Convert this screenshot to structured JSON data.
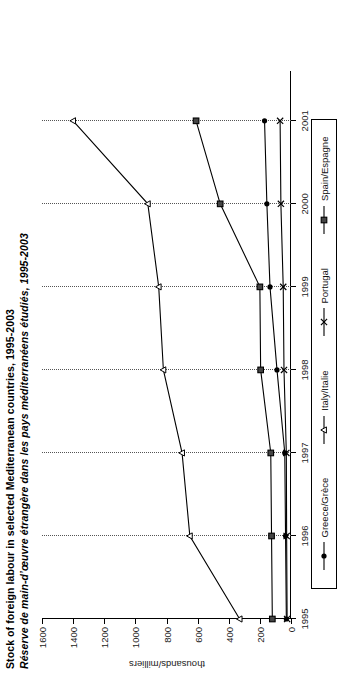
{
  "title": {
    "en": "Stock of foreign labour in selected Mediterranean countries, 1995-2003",
    "fr": "Réserve de main-d’œuvre étrangère dans les pays méditerranéens étudiés, 1995-2003"
  },
  "chart_data": {
    "type": "line",
    "title": "Stock of foreign labour in selected Mediterranean countries, 1995-2003",
    "subtitle": "Réserve de main-d’œuvre étrangère dans les pays méditerranéens étudiés, 1995-2003",
    "xlabel": "",
    "ylabel": "thousands/milliers",
    "x": [
      1995,
      1996,
      1997,
      1998,
      1999,
      2000,
      2001
    ],
    "xtick_labels": [
      "1995",
      "1996",
      "1997",
      "1998",
      "1999",
      "2000",
      "2001"
    ],
    "xlim": [
      1995,
      2001.6
    ],
    "ylim": [
      0,
      1600
    ],
    "yticks": [
      0,
      200,
      400,
      600,
      800,
      1000,
      1200,
      1400,
      1600
    ],
    "ytick_labels": [
      "0",
      "200",
      "400",
      "600",
      "800",
      "1000",
      "1200",
      "1400",
      "1600"
    ],
    "grid": "vertical-dotted",
    "legend_position": "bottom",
    "series": [
      {
        "name": "Greece/Grèce",
        "marker": "filled-circle",
        "color": "#000000",
        "values": [
          30,
          35,
          40,
          90,
          135,
          155,
          170
        ]
      },
      {
        "name": "Italy/Italie",
        "marker": "open-triangle",
        "color": "#000000",
        "values": [
          330,
          650,
          700,
          820,
          850,
          920,
          1400
        ]
      },
      {
        "name": "Portugal",
        "marker": "cross-x",
        "color": "#000000",
        "values": [
          25,
          28,
          30,
          45,
          50,
          65,
          70
        ]
      },
      {
        "name": "Spain/Espagne",
        "marker": "filled-square",
        "color": "#000000",
        "values": [
          120,
          125,
          130,
          195,
          200,
          455,
          610
        ]
      }
    ]
  },
  "legend": {
    "items": [
      {
        "label": "Greece/Grèce",
        "marker": "filled-circle"
      },
      {
        "label": "Italy/Italie",
        "marker": "open-triangle"
      },
      {
        "label": "Portugal",
        "marker": "cross-x"
      },
      {
        "label": "Spain/Espagne",
        "marker": "filled-square"
      }
    ]
  },
  "axis": {
    "y_axis_title": "thousands/milliers"
  }
}
